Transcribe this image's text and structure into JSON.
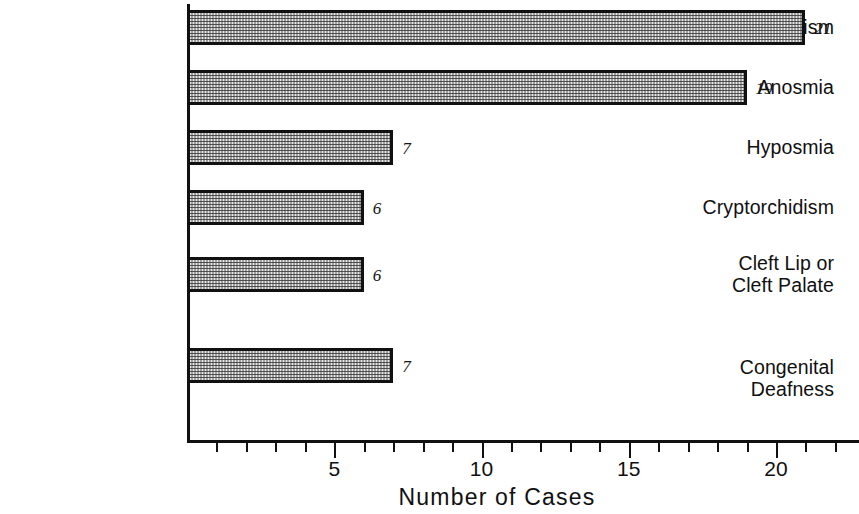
{
  "chart_data": {
    "type": "bar",
    "orientation": "horizontal",
    "title": "",
    "xlabel": "Number of Cases",
    "ylabel": "",
    "categories": [
      "Hypogonadism",
      "Anosmia",
      "Hyposmia",
      "Cryptorchidism",
      "Cleft Lip or\nCleft Palate",
      "Congenital\nDeafness"
    ],
    "values": [
      21,
      19,
      7,
      6,
      6,
      7
    ],
    "value_labels": [
      "21",
      "19",
      "7",
      "6",
      "6",
      "7"
    ],
    "xlim": [
      0,
      22
    ],
    "xtick_labels": [
      "5",
      "10",
      "15",
      "20"
    ],
    "xtick_values": [
      5,
      10,
      15,
      20
    ],
    "minor_tick_step": 1,
    "grid": false,
    "legend": null,
    "colors": {
      "bar_fill": "#e8e8e8",
      "bar_border": "#111111",
      "axis": "#111111",
      "text": "#101010"
    }
  },
  "layout": {
    "axis_x_px": 187,
    "px_per_unit": 29.45,
    "bar_height_px": 35,
    "axis_bottom_px": 440,
    "row_tops_px": [
      10,
      70,
      130,
      190,
      257,
      348
    ],
    "label_tops_px": [
      16,
      76,
      136,
      196,
      252,
      356
    ],
    "x_title_center_px": 497
  }
}
